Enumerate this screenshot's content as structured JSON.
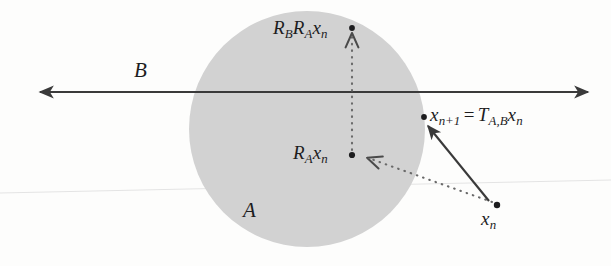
{
  "figure": {
    "type": "geometric-diagram",
    "background_color": "#fdfdfc",
    "disk_fill_color": "#d2d2d2",
    "line_color": "#3a3a3a",
    "scan_line_color": "#e2e2e2"
  },
  "labels": {
    "line_B": "B",
    "disk_A": "A",
    "reflect_A": {
      "R": "R",
      "R_sub": "A",
      "x": "x",
      "x_sub": "n"
    },
    "reflect_BA": {
      "R1": "R",
      "R1_sub": "B",
      "R2": "R",
      "R2_sub": "A",
      "x": "x",
      "x_sub": "n"
    },
    "next_point": {
      "x": "x",
      "x_sub": "n+1",
      "eq": "=",
      "T": "T",
      "T_sub": "A,B",
      "x2": "x",
      "x2_sub": "n"
    },
    "start_point": {
      "x": "x",
      "x_sub": "n"
    }
  },
  "geometry": {
    "disk": {
      "cx": 307,
      "cy": 129,
      "r": 118
    },
    "axis_line": {
      "x1": 36,
      "y1": 92,
      "x2": 592,
      "y2": 92,
      "arrow_both_ends": true
    },
    "points": [
      {
        "name": "x_n",
        "x": 497,
        "y": 205
      },
      {
        "name": "R_A x_n",
        "x": 352,
        "y": 155
      },
      {
        "name": "R_B R_A x_n",
        "x": 352,
        "y": 28
      },
      {
        "name": "x_n+1",
        "x": 423,
        "y": 117
      }
    ],
    "dotted_paths": [
      {
        "from": "x_n",
        "to": "R_A x_n",
        "style": "dotted",
        "arrowhead_at_end": true
      },
      {
        "from": "R_A x_n",
        "to": "R_B R_A x_n",
        "style": "dotted",
        "arrowhead_at_end": true
      }
    ],
    "solid_paths": [
      {
        "from": "x_n",
        "to": "x_n+1",
        "style": "solid",
        "arrowhead_at_end": true
      }
    ],
    "scan_artifact_line": {
      "x1": 0,
      "y1": 193,
      "x2": 611,
      "y2": 180
    }
  }
}
